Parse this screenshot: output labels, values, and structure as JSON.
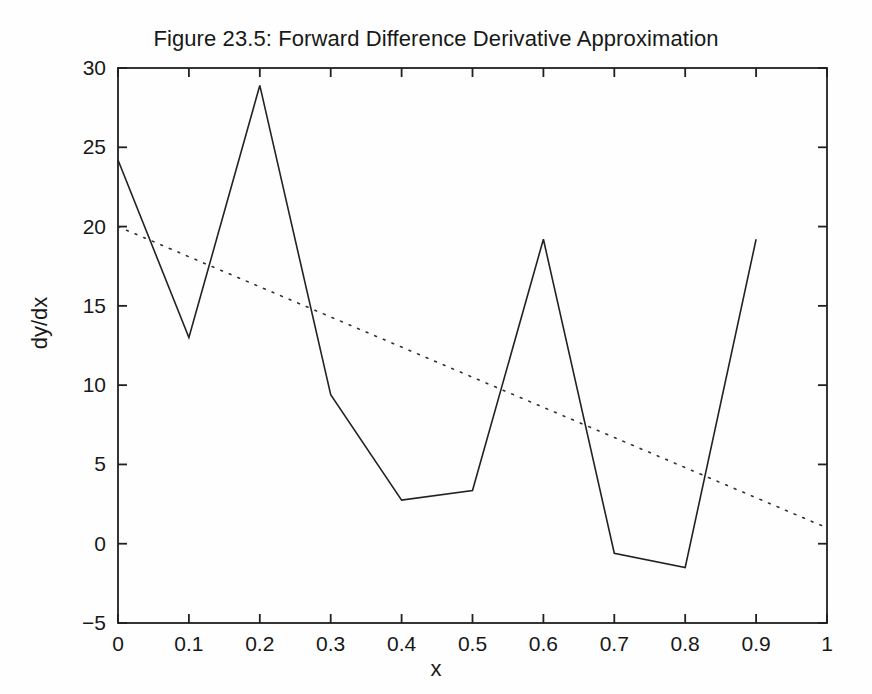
{
  "figure": {
    "title": "Figure 23.5: Forward Difference Derivative Approximation",
    "background_color": "#fefefe",
    "foreground_color": "#181818"
  },
  "chart_data": {
    "type": "line",
    "title": "Figure 23.5: Forward Difference Derivative Approximation",
    "xlabel": "x",
    "ylabel": "dy/dx",
    "xlim": [
      0,
      1
    ],
    "ylim": [
      -5,
      30
    ],
    "xticks": [
      0,
      0.1,
      0.2,
      0.3,
      0.4,
      0.5,
      0.6,
      0.7,
      0.8,
      0.9,
      1
    ],
    "xticklabels": [
      "0",
      "0.1",
      "0.2",
      "0.3",
      "0.4",
      "0.5",
      "0.6",
      "0.7",
      "0.8",
      "0.9",
      "1"
    ],
    "yticks": [
      -5,
      0,
      5,
      10,
      15,
      20,
      25,
      30
    ],
    "yticklabels": [
      "-5",
      "0",
      "5",
      "10",
      "15",
      "20",
      "25",
      "30"
    ],
    "grid": false,
    "legend": null,
    "box": true,
    "series": [
      {
        "name": "forward-difference-approximation",
        "style": "solid",
        "color": "#222222",
        "linewidth": 1.6,
        "x": [
          0,
          0.1,
          0.2,
          0.3,
          0.4,
          0.5,
          0.6,
          0.7,
          0.8,
          0.9
        ],
        "values": [
          24.2,
          13.0,
          28.9,
          9.4,
          2.75,
          3.35,
          19.2,
          -0.6,
          -1.5,
          19.2
        ]
      },
      {
        "name": "exact-derivative",
        "style": "dotted",
        "color": "#303030",
        "linewidth": 1.6,
        "x": [
          0,
          1
        ],
        "values": [
          20.0,
          1.0
        ]
      }
    ]
  }
}
